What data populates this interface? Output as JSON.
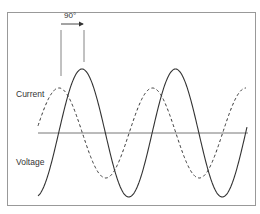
{
  "diagram": {
    "title": "",
    "phase_label": "90°",
    "labels": {
      "current": "Current",
      "voltage": "Voltage"
    },
    "series": [
      {
        "name": "Current",
        "style": "dashed",
        "phase_lead_deg": 90
      },
      {
        "name": "Voltage",
        "style": "solid",
        "phase_lead_deg": 0
      }
    ],
    "colors": {
      "curve": "#333333",
      "axis": "#777777",
      "frame": "#999999"
    }
  }
}
